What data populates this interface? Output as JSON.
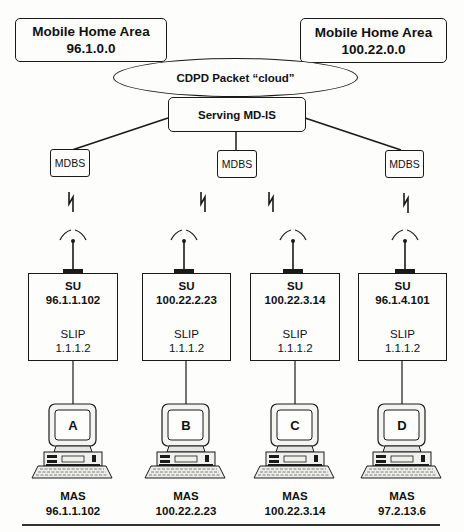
{
  "diagram": {
    "home_areas": [
      {
        "title": "Mobile Home Area",
        "address": "96.1.0.0"
      },
      {
        "title": "Mobile Home Area",
        "address": "100.22.0.0"
      }
    ],
    "cloud": {
      "label": "CDPD Packet “cloud”"
    },
    "md_is": {
      "label": "Serving MD-IS"
    },
    "mdbs": [
      {
        "label": "MDBS"
      },
      {
        "label": "MDBS"
      },
      {
        "label": "MDBS"
      }
    ],
    "subscriber_units": [
      {
        "title": "SU",
        "address": "96.1.1.102",
        "slip_label": "SLIP",
        "slip_address": "1.1.1.2"
      },
      {
        "title": "SU",
        "address": "100.22.2.23",
        "slip_label": "SLIP",
        "slip_address": "1.1.1.2"
      },
      {
        "title": "SU",
        "address": "100.22.3.14",
        "slip_label": "SLIP",
        "slip_address": "1.1.1.2"
      },
      {
        "title": "SU",
        "address": "96.1.4.101",
        "slip_label": "SLIP",
        "slip_address": "1.1.1.2"
      }
    ],
    "hosts": [
      {
        "screen_letter": "A",
        "label": "MAS",
        "address": "96.1.1.102"
      },
      {
        "screen_letter": "B",
        "label": "MAS",
        "address": "100.22.2.23"
      },
      {
        "screen_letter": "C",
        "label": "MAS",
        "address": "100.22.3.14"
      },
      {
        "screen_letter": "D",
        "label": "MAS",
        "address": "97.2.13.6"
      }
    ],
    "icons": {
      "radio_link": "lightning-bolt-icon",
      "antenna": "antenna-icon",
      "computer": "desktop-computer-icon"
    }
  }
}
